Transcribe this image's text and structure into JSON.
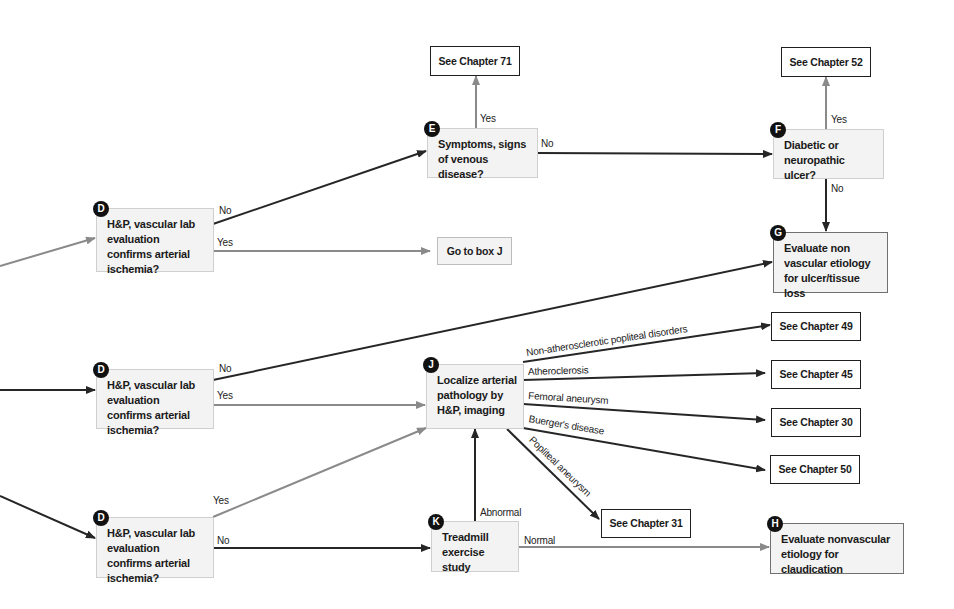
{
  "colors": {
    "dark_line": "#262626",
    "gray_line": "#8a8a8a",
    "box_fill": "#f3f3f3",
    "badge": "#111111"
  },
  "nodes": {
    "d1": {
      "badge": "D",
      "text": "H&P, vascular lab evaluation confirms arterial ischemia?"
    },
    "d2": {
      "badge": "D",
      "text": "H&P, vascular lab evaluation confirms arterial ischemia?"
    },
    "d3": {
      "badge": "D",
      "text": "H&P, vascular lab evaluation confirms arterial ischemia?"
    },
    "e": {
      "badge": "E",
      "text": "Symptoms, signs of venous disease?"
    },
    "f": {
      "badge": "F",
      "text": "Diabetic or neuropathic ulcer?"
    },
    "g": {
      "badge": "G",
      "text": "Evaluate non vascular etiology for ulcer/tissue loss"
    },
    "h": {
      "badge": "H",
      "text": "Evaluate nonvascular etiology for claudication"
    },
    "j": {
      "badge": "J",
      "text": "Localize arterial pathology by H&P, imaging"
    },
    "k": {
      "badge": "K",
      "text": "Treadmill exercise study"
    },
    "goto_j": {
      "text": "Go to box J"
    },
    "ch71": {
      "text": "See Chapter 71"
    },
    "ch52": {
      "text": "See Chapter 52"
    },
    "ch49": {
      "text": "See Chapter 49"
    },
    "ch45": {
      "text": "See Chapter 45"
    },
    "ch30": {
      "text": "See Chapter 30"
    },
    "ch50": {
      "text": "See Chapter 50"
    },
    "ch31": {
      "text": "See Chapter 31"
    }
  },
  "edge_labels": {
    "d1_no": "No",
    "d1_yes": "Yes",
    "e_yes": "Yes",
    "e_no": "No",
    "f_yes": "Yes",
    "f_no": "No",
    "d2_no": "No",
    "d2_yes": "Yes",
    "d3_yes": "Yes",
    "d3_no": "No",
    "k_abnormal": "Abnormal",
    "k_normal": "Normal",
    "j_popliteal_disorders": "Non-atherosclerotic popliteal disorders",
    "j_atherosclerosis": "Atheroclerosis",
    "j_femoral": "Femoral aneurysm",
    "j_buerger": "Buerger's disease",
    "j_popliteal_aneurysm": "Popliteal aneurysm"
  }
}
